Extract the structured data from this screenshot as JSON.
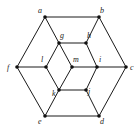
{
  "graph": {
    "vertices": [
      {
        "id": "a",
        "label": "a",
        "x": 45,
        "y": 17,
        "lx": 38,
        "ly": 13
      },
      {
        "id": "b",
        "label": "b",
        "x": 99,
        "y": 17,
        "lx": 100,
        "ly": 13
      },
      {
        "id": "c",
        "label": "c",
        "x": 126,
        "y": 67,
        "lx": 130,
        "ly": 70
      },
      {
        "id": "d",
        "label": "d",
        "x": 99,
        "y": 116,
        "lx": 100,
        "ly": 124
      },
      {
        "id": "e",
        "label": "e",
        "x": 45,
        "y": 116,
        "lx": 38,
        "ly": 124
      },
      {
        "id": "f",
        "label": "f",
        "x": 17,
        "y": 67,
        "lx": 7,
        "ly": 70
      },
      {
        "id": "g",
        "label": "g",
        "x": 59,
        "y": 43,
        "lx": 60,
        "ly": 38
      },
      {
        "id": "h",
        "label": "h",
        "x": 86,
        "y": 43,
        "lx": 87,
        "ly": 38
      },
      {
        "id": "i",
        "label": "i",
        "x": 97,
        "y": 67,
        "lx": 99,
        "ly": 62
      },
      {
        "id": "l",
        "label": "l",
        "x": 46,
        "y": 67,
        "lx": 41,
        "ly": 62
      },
      {
        "id": "m",
        "label": "m",
        "x": 72,
        "y": 67,
        "lx": 73,
        "ly": 62
      },
      {
        "id": "k",
        "label": "k",
        "x": 59,
        "y": 90,
        "lx": 52,
        "ly": 96
      },
      {
        "id": "j",
        "label": "j",
        "x": 86,
        "y": 90,
        "lx": 88,
        "ly": 94
      }
    ],
    "edges": [
      [
        "a",
        "b"
      ],
      [
        "b",
        "c"
      ],
      [
        "c",
        "d"
      ],
      [
        "d",
        "e"
      ],
      [
        "e",
        "f"
      ],
      [
        "f",
        "a"
      ],
      [
        "a",
        "g"
      ],
      [
        "b",
        "h"
      ],
      [
        "c",
        "i"
      ],
      [
        "d",
        "j"
      ],
      [
        "e",
        "k"
      ],
      [
        "f",
        "l"
      ],
      [
        "g",
        "h"
      ],
      [
        "h",
        "i"
      ],
      [
        "i",
        "j"
      ],
      [
        "j",
        "k"
      ],
      [
        "k",
        "l"
      ],
      [
        "l",
        "g"
      ],
      [
        "g",
        "m"
      ],
      [
        "m",
        "i"
      ],
      [
        "m",
        "k"
      ]
    ]
  }
}
